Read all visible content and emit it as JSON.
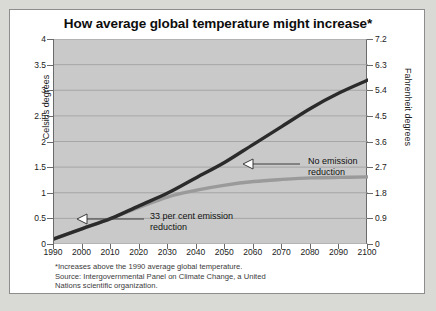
{
  "chart_data": {
    "type": "line",
    "title": "How average global temperature might increase*",
    "xlabel": "",
    "ylabel": "Celsius degrees",
    "y2label": "Fahrenheit degrees",
    "xlim": [
      1990,
      2100
    ],
    "ylim": [
      0,
      4
    ],
    "y2lim": [
      0,
      7.2
    ],
    "grid": true,
    "legend_position": "inline-annotations",
    "xticks": [
      "1990",
      "2000",
      "2010",
      "2020",
      "2030",
      "2040",
      "2050",
      "2060",
      "2070",
      "2080",
      "2090",
      "2100"
    ],
    "yticks": [
      "0",
      "0.5",
      "1",
      "1.5",
      "2",
      "2.5",
      "3",
      "3.5",
      "4"
    ],
    "y2ticks": [
      "0",
      "0.9",
      "1.8",
      "2.7",
      "3.6",
      "4.5",
      "5.4",
      "6.3",
      "7.2"
    ],
    "x": [
      1990,
      2000,
      2010,
      2020,
      2030,
      2040,
      2050,
      2060,
      2070,
      2080,
      2090,
      2100
    ],
    "series": [
      {
        "name": "No emission reduction",
        "color": "#2b2b2b",
        "values": [
          0.1,
          0.3,
          0.5,
          0.75,
          1.0,
          1.3,
          1.6,
          1.95,
          2.3,
          2.65,
          2.95,
          3.2
        ]
      },
      {
        "name": "33 per cent emission reduction",
        "color": "#9a9a9a",
        "values": [
          0.1,
          0.3,
          0.5,
          0.72,
          0.92,
          1.05,
          1.15,
          1.22,
          1.26,
          1.29,
          1.3,
          1.31
        ]
      }
    ],
    "annotations": [
      {
        "text_line1": "No emission",
        "text_line2": "reduction"
      },
      {
        "text_line1": "33 per cent emission",
        "text_line2": "reduction"
      }
    ],
    "footnote": {
      "line1": "*Increases above the 1990 average global temperature.",
      "line2": "Source: Intergovernmental Panel on Climate Change, a United",
      "line3": "Nations scientific organization."
    },
    "colors": {
      "plot_background": "#c9c9c9",
      "card_background": "#ffffff",
      "page_background": "#d9d9d6",
      "gridline": "#9d9d9d",
      "axis": "#6a6a6a"
    }
  }
}
